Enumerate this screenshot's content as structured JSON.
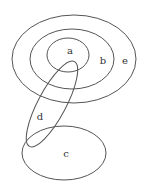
{
  "diagram": {
    "type": "venn-like nested ellipses",
    "stroke_color": "#555555",
    "sets": [
      {
        "id": "e",
        "label": "e",
        "cx": 74,
        "cy": 59,
        "rx": 62,
        "ry": 44,
        "rotate": 0,
        "label_x": 125,
        "label_y": 61
      },
      {
        "id": "b",
        "label": "b",
        "cx": 72,
        "cy": 59,
        "rx": 42,
        "ry": 30,
        "rotate": 0,
        "label_x": 103,
        "label_y": 61
      },
      {
        "id": "a",
        "label": "a",
        "cx": 68,
        "cy": 55,
        "rx": 21,
        "ry": 17,
        "rotate": 0,
        "label_x": 70,
        "label_y": 51
      },
      {
        "id": "d",
        "label": "d",
        "cx": 52,
        "cy": 104,
        "rx": 48,
        "ry": 14,
        "rotate": -62,
        "label_x": 40,
        "label_y": 117
      },
      {
        "id": "c",
        "label": "c",
        "cx": 64,
        "cy": 153,
        "rx": 42,
        "ry": 27,
        "rotate": 0,
        "label_x": 66,
        "label_y": 154
      }
    ]
  }
}
